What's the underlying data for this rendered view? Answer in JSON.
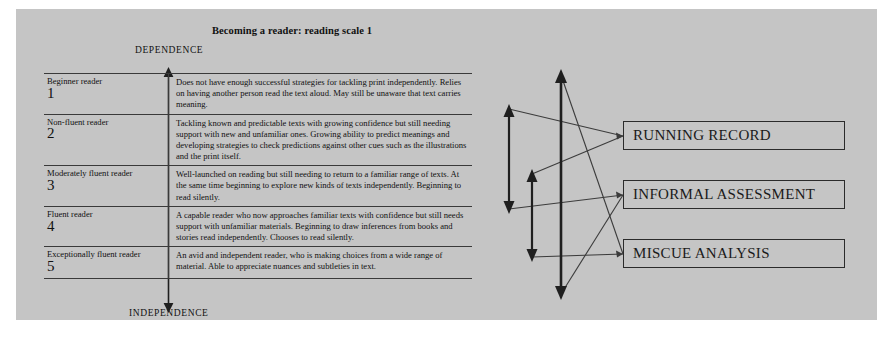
{
  "panel": {
    "background_color": "#c5c5c5",
    "page_background_color": "#ffffff"
  },
  "scale": {
    "title": "Becoming a reader: reading scale 1",
    "axis_top_label": "DEPENDENCE",
    "axis_bottom_label": "INDEPENDENCE",
    "rows": [
      {
        "name": "Beginner reader",
        "number": "1",
        "description": "Does not have enough successful strategies for tackling print independently. Relies on having another person read the text aloud. May still be unaware that text carries meaning."
      },
      {
        "name": "Non-fluent reader",
        "number": "2",
        "description": "Tackling known and predictable texts with growing confidence but still needing support with new and unfamiliar ones. Growing ability to predict meanings and developing strategies to check predictions against other cues such as the illustrations and the print itself."
      },
      {
        "name": "Moderately fluent reader",
        "number": "3",
        "description": "Well-launched on reading but still needing to return to a familiar range of texts. At the same time beginning to explore new kinds of texts independently. Beginning to read silently."
      },
      {
        "name": "Fluent reader",
        "number": "4",
        "description": "A capable reader who now approaches familiar texts with confidence but still needs support with unfamiliar materials. Beginning to draw inferences from books and stories read independently. Chooses to read silently."
      },
      {
        "name": "Exceptionally fluent reader",
        "number": "5",
        "description": "An avid and independent reader, who is making choices from a wide range of material. Able to appreciate nuances and subtleties in text."
      }
    ]
  },
  "diagram": {
    "boxes": [
      {
        "id": "running",
        "label": "RUNNING RECORD"
      },
      {
        "id": "informal",
        "label": "INFORMAL ASSESSMENT"
      },
      {
        "id": "miscue",
        "label": "MISCUE ANALYSIS"
      }
    ],
    "range_arrows": [
      {
        "id": "arrow-short-upper",
        "span": "narrow upper range"
      },
      {
        "id": "arrow-short-lower",
        "span": "narrow middle range"
      },
      {
        "id": "arrow-tall",
        "span": "full range"
      }
    ],
    "stroke_color": "#1f1f1f"
  }
}
